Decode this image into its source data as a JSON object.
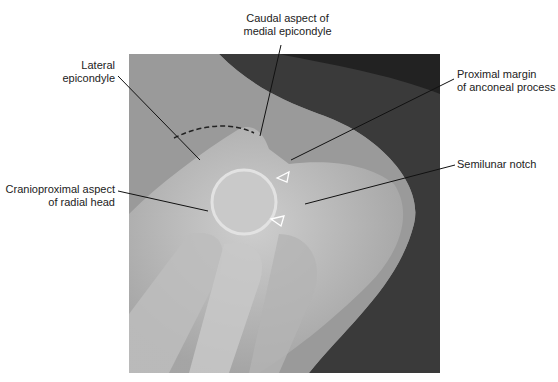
{
  "figure": {
    "type": "radiograph",
    "labels": {
      "caudal_medial": {
        "line1": "Caudal aspect of",
        "line2": "medial epicondyle"
      },
      "lateral": {
        "line1": "Lateral",
        "line2": "epicondyle"
      },
      "anconeal": {
        "line1": "Proximal margin",
        "line2": "of anconeal process"
      },
      "semilunar": {
        "line1": "Semilunar notch"
      },
      "radial": {
        "line1": "Cranioproximal aspect",
        "line2": "of radial head"
      }
    },
    "markers": {
      "arrowheads": 2,
      "dashed_arc": "lateral epicondyle outline"
    }
  }
}
